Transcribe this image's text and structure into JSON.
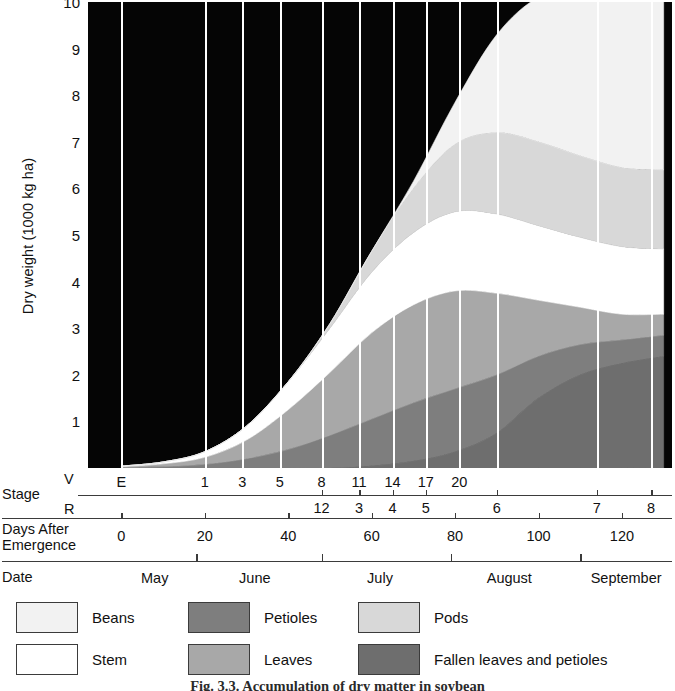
{
  "chart_data": {
    "type": "area",
    "title": "Accumulation of dry matter in soybean",
    "ylabel": "Dry weight (1000 kg ha)",
    "ylim": [
      0,
      10
    ],
    "yticks": [
      1,
      2,
      3,
      4,
      5,
      6,
      7,
      8,
      9,
      10
    ],
    "xlabel": "Days After Emergence",
    "xlim": [
      -8,
      132
    ],
    "grid": "vertical-white-gridlines-at-v-stage-marks",
    "legend_position": "below-axes",
    "stacked": true,
    "stack_order_bottom_to_top": [
      "Fallen leaves and petioles",
      "Petioles",
      "Leaves",
      "Stem",
      "Pods",
      "Beans"
    ],
    "x": [
      0,
      10,
      20,
      30,
      40,
      50,
      60,
      70,
      80,
      90,
      100,
      110,
      120,
      130
    ],
    "series": [
      {
        "name": "Fallen leaves and petioles",
        "color": "#6e6e6e",
        "values": [
          0,
          0,
          0,
          0,
          0,
          0,
          0.05,
          0.15,
          0.35,
          0.75,
          1.5,
          2.0,
          2.25,
          2.4
        ]
      },
      {
        "name": "Petioles",
        "color": "#7e7e7e",
        "values": [
          0.01,
          0.03,
          0.08,
          0.2,
          0.4,
          0.7,
          1.0,
          1.25,
          1.35,
          1.25,
          0.9,
          0.65,
          0.5,
          0.45
        ]
      },
      {
        "name": "Leaves",
        "color": "#a8a8a8",
        "values": [
          0.02,
          0.06,
          0.15,
          0.4,
          0.85,
          1.35,
          1.85,
          2.1,
          2.1,
          1.75,
          1.2,
          0.8,
          0.55,
          0.45
        ]
      },
      {
        "name": "Stem",
        "color": "#ffffff",
        "values": [
          0.01,
          0.04,
          0.12,
          0.3,
          0.6,
          0.95,
          1.3,
          1.55,
          1.7,
          1.7,
          1.6,
          1.5,
          1.45,
          1.4
        ]
      },
      {
        "name": "Pods",
        "color": "#d8d8d8",
        "values": [
          0,
          0,
          0,
          0,
          0,
          0.1,
          0.45,
          0.95,
          1.45,
          1.75,
          1.8,
          1.75,
          1.7,
          1.7
        ]
      },
      {
        "name": "Beans",
        "color": "#f2f2f2",
        "values": [
          0,
          0,
          0,
          0,
          0,
          0,
          0,
          0.15,
          0.9,
          2.1,
          3.1,
          3.55,
          3.7,
          3.75
        ]
      }
    ],
    "total_top_curve": [
      0.04,
      0.13,
      0.35,
      0.9,
      1.85,
      3.1,
      4.65,
      6.15,
      7.85,
      9.3,
      10.1,
      10.25,
      10.15,
      10.15
    ]
  },
  "y_axis": {
    "label": "Dry weight (1000 kg ha)",
    "ticks": [
      "10",
      "9",
      "8",
      "7",
      "6",
      "5",
      "4",
      "3",
      "2",
      "1"
    ]
  },
  "stage_axis": {
    "row_label": "Stage",
    "v_label": "V",
    "r_label": "R",
    "v_stages": [
      {
        "label": "E",
        "day": 0
      },
      {
        "label": "1",
        "day": 20
      },
      {
        "label": "3",
        "day": 29
      },
      {
        "label": "5",
        "day": 38
      },
      {
        "label": "8",
        "day": 48
      },
      {
        "label": "11",
        "day": 57
      },
      {
        "label": "14",
        "day": 65
      },
      {
        "label": "17",
        "day": 73
      },
      {
        "label": "20",
        "day": 81
      }
    ],
    "r_stages": [
      {
        "label": "12",
        "day": 48
      },
      {
        "label": "3",
        "day": 57
      },
      {
        "label": "4",
        "day": 65
      },
      {
        "label": "5",
        "day": 73
      },
      {
        "label": "6",
        "day": 90
      },
      {
        "label": "7",
        "day": 114
      },
      {
        "label": "8",
        "day": 127
      }
    ]
  },
  "days_axis": {
    "row_label_line1": "Days After",
    "row_label_line2": "Emergence",
    "ticks": [
      "0",
      "20",
      "40",
      "60",
      "80",
      "100",
      "120"
    ],
    "tick_days": [
      0,
      20,
      40,
      60,
      80,
      100,
      120
    ]
  },
  "date_axis": {
    "row_label": "Date",
    "months": [
      {
        "label": "May",
        "center_day": 8
      },
      {
        "label": "June",
        "center_day": 32
      },
      {
        "label": "July",
        "center_day": 62
      },
      {
        "label": "August",
        "center_day": 93
      },
      {
        "label": "September",
        "center_day": 121
      }
    ],
    "dividers_day": [
      18,
      48,
      79,
      110
    ]
  },
  "legend": {
    "items": [
      {
        "label": "Beans",
        "color": "#f2f2f2",
        "col": 0,
        "row": 0
      },
      {
        "label": "Stem",
        "color": "#ffffff",
        "col": 0,
        "row": 1
      },
      {
        "label": "Petioles",
        "color": "#7e7e7e",
        "col": 1,
        "row": 0
      },
      {
        "label": "Leaves",
        "color": "#a8a8a8",
        "col": 1,
        "row": 1
      },
      {
        "label": "Pods",
        "color": "#d8d8d8",
        "col": 2,
        "row": 0
      },
      {
        "label": "Fallen leaves and petioles",
        "color": "#6e6e6e",
        "col": 2,
        "row": 1
      }
    ]
  },
  "caption": {
    "text": "Fig. 3.3.  Accumulation of dry matter in soybean"
  }
}
